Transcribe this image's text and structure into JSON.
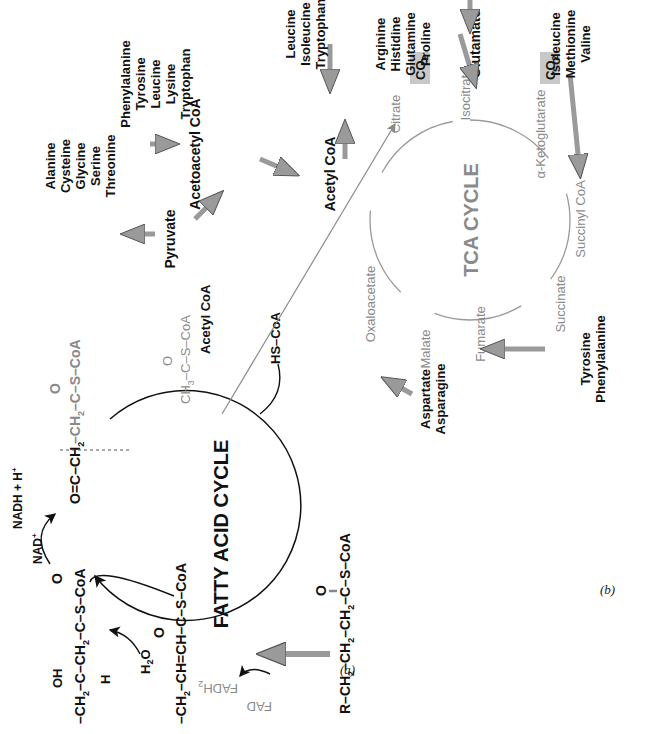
{
  "figure": {
    "orientation": "rotated 90 degrees counter-clockwise",
    "colors": {
      "black": "#111111",
      "gray_text": "#8a8a8a",
      "block_arrow": "#a0a0a0",
      "co2_box": "#c8c8c8"
    },
    "panel_a": {
      "label": "(a)",
      "title": "FATTY ACID CYCLE",
      "substrate": {
        "r": "R",
        "ch2_1": "CH2",
        "ch2_2": "CH2",
        "ch2_3": "CH2",
        "c": "C",
        "o": "O",
        "scoa": "S–CoA",
        "text": "R–CH2–CH2–CH2–C(=O)–S–CoA"
      },
      "intermediates": [
        {
          "name": "enoyl-CoA",
          "text": "–CH2–CH=CH–C(=O)–S–CoA",
          "parts": [
            "–CH2–",
            "CH=",
            "CH–",
            "C",
            "–S–CoA",
            "O"
          ]
        },
        {
          "name": "hydroxyacyl-CoA",
          "text": "–CH2–C(OH)(H)–CH2–C(=O)–S–CoA",
          "parts": [
            "–CH2–",
            "C",
            "–CH2–",
            "C",
            "–S–CoA",
            "OH",
            "H",
            "O"
          ]
        },
        {
          "name": "ketoacyl-CoA",
          "text": "O=C(–CH2–)–CH2–C(=O)–S–CoA",
          "parts": [
            "O=",
            "C",
            "–CH2",
            "CH2",
            "C",
            "–S–CoA",
            "O"
          ]
        }
      ],
      "cofactors": {
        "fad": "FAD",
        "fadh2": "FADH2",
        "h2o": "H2O",
        "nad": "NAD+",
        "nadh": "NADH + H+",
        "hscoa": "HS–CoA"
      },
      "product": {
        "formula": "CH3–C(=O)–S–CoA",
        "label": "Acetyl CoA"
      }
    },
    "panel_b": {
      "label": "(b)",
      "title": "TCA CYCLE",
      "tca_intermediates": [
        "Citrate",
        "Isocitrate",
        "α-Ketoglutarate",
        "Succinyl CoA",
        "Succinate",
        "Fumarate",
        "Malate",
        "Oxaloacetate"
      ],
      "co2": [
        "CO2",
        "CO2"
      ],
      "hubs": {
        "pyruvate": "Pyruvate",
        "acetoacetyl": "Acetoacetyl CoA",
        "acetyl": "Acetyl CoA",
        "glutamate": "Glutamate"
      },
      "amino_acid_groups": [
        {
          "target": "Pyruvate",
          "items": [
            "Alanine",
            "Cysteine",
            "Glycine",
            "Serine",
            "Threonine"
          ]
        },
        {
          "target": "Acetoacetyl CoA",
          "items": [
            "Phenylalanine",
            "Tyrosine",
            "Leucine",
            "Lysine",
            "Tryptophan"
          ]
        },
        {
          "target": "Acetyl CoA",
          "items": [
            "Leucine",
            "Isoleucine",
            "Tryptophan"
          ]
        },
        {
          "target": "Glutamate",
          "items": [
            "Arginine",
            "Histidine",
            "Glutamine",
            "Proline"
          ]
        },
        {
          "target": "Succinyl CoA",
          "items": [
            "Isoleucine",
            "Methionine",
            "Valine"
          ]
        },
        {
          "target": "Fumarate",
          "items": [
            "Tyrosine",
            "Phenylalanine"
          ]
        },
        {
          "target": "Oxaloacetate",
          "items": [
            "Aspartate",
            "Asparagine"
          ]
        }
      ]
    }
  }
}
